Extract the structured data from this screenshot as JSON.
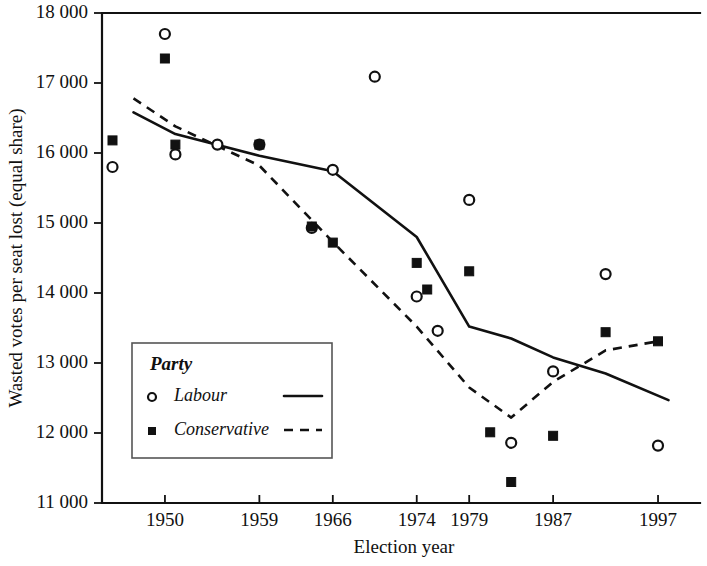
{
  "chart_data": {
    "type": "scatter",
    "title": "",
    "xlabel": "Election year",
    "ylabel": "Wasted votes per seat  lost (equal share)",
    "xlim": [
      1944,
      2001
    ],
    "ylim": [
      11000,
      18000
    ],
    "grid": false,
    "y_ticks": [
      "11 000",
      "12 000",
      "13 000",
      "14 000",
      "15 000",
      "16 000",
      "17 000",
      "18 000"
    ],
    "y_tick_values": [
      11000,
      12000,
      13000,
      14000,
      15000,
      16000,
      17000,
      18000
    ],
    "x_ticks": [
      "1950",
      "1959",
      "1966",
      "1974",
      "1979",
      "1987",
      "1997"
    ],
    "x_tick_values": [
      1950,
      1959,
      1966,
      1974,
      1979,
      1987,
      1997
    ],
    "legend": {
      "title": "Party",
      "position": "lower-left",
      "entries": [
        {
          "name": "Labour",
          "marker": "open-circle",
          "line": "solid"
        },
        {
          "name": "Conservative",
          "marker": "filled-square",
          "line": "dashed"
        }
      ]
    },
    "series": [
      {
        "name": "Labour",
        "marker": "open-circle",
        "line_style": "solid",
        "points": [
          {
            "x": 1945,
            "y": 15800
          },
          {
            "x": 1950,
            "y": 17700
          },
          {
            "x": 1951,
            "y": 15980
          },
          {
            "x": 1955,
            "y": 16120
          },
          {
            "x": 1959,
            "y": 16120
          },
          {
            "x": 1964,
            "y": 14930
          },
          {
            "x": 1966,
            "y": 15760
          },
          {
            "x": 1970,
            "y": 17090
          },
          {
            "x": 1974,
            "y": 13950
          },
          {
            "x": 1976,
            "y": 13460
          },
          {
            "x": 1979,
            "y": 15330
          },
          {
            "x": 1983,
            "y": 11860
          },
          {
            "x": 1987,
            "y": 12880
          },
          {
            "x": 1992,
            "y": 14270
          },
          {
            "x": 1997,
            "y": 11820
          }
        ],
        "trend": [
          {
            "x": 1947,
            "y": 16580
          },
          {
            "x": 1951,
            "y": 16270
          },
          {
            "x": 1959,
            "y": 15960
          },
          {
            "x": 1966,
            "y": 15740
          },
          {
            "x": 1974,
            "y": 14800
          },
          {
            "x": 1979,
            "y": 13520
          },
          {
            "x": 1983,
            "y": 13350
          },
          {
            "x": 1987,
            "y": 13080
          },
          {
            "x": 1992,
            "y": 12850
          },
          {
            "x": 1998,
            "y": 12470
          }
        ]
      },
      {
        "name": "Conservative",
        "marker": "filled-square",
        "line_style": "dashed",
        "points": [
          {
            "x": 1945,
            "y": 16180
          },
          {
            "x": 1950,
            "y": 17350
          },
          {
            "x": 1951,
            "y": 16120
          },
          {
            "x": 1959,
            "y": 16120
          },
          {
            "x": 1964,
            "y": 14950
          },
          {
            "x": 1966,
            "y": 14720
          },
          {
            "x": 1974,
            "y": 14430
          },
          {
            "x": 1975,
            "y": 14050
          },
          {
            "x": 1979,
            "y": 14310
          },
          {
            "x": 1981,
            "y": 12010
          },
          {
            "x": 1983,
            "y": 11300
          },
          {
            "x": 1987,
            "y": 11960
          },
          {
            "x": 1992,
            "y": 13440
          },
          {
            "x": 1997,
            "y": 13310
          }
        ],
        "trend": [
          {
            "x": 1947,
            "y": 16780
          },
          {
            "x": 1951,
            "y": 16380
          },
          {
            "x": 1959,
            "y": 15820
          },
          {
            "x": 1966,
            "y": 14730
          },
          {
            "x": 1974,
            "y": 13520
          },
          {
            "x": 1979,
            "y": 12650
          },
          {
            "x": 1983,
            "y": 12220
          },
          {
            "x": 1987,
            "y": 12730
          },
          {
            "x": 1992,
            "y": 13180
          },
          {
            "x": 1997,
            "y": 13310
          }
        ]
      }
    ]
  }
}
